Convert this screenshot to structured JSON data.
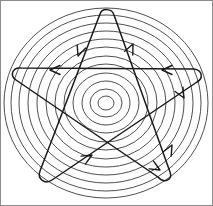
{
  "figure": {
    "name": "pentagram-over-concentric-circles",
    "background_color": "#ffffff",
    "border_color": "#8c8c8c",
    "width": 213,
    "height": 206
  },
  "chart_data": {
    "type": "diagram",
    "title": "",
    "subtitle": "",
    "xlabel": "",
    "ylabel": "",
    "center": {
      "x": 106,
      "y": 103
    },
    "rings": {
      "name": "concentric-circles",
      "count": 12,
      "stroke_color": "#3a3a3a",
      "stroke_width": 0.9,
      "radii_x": [
        8,
        16,
        24,
        33,
        42,
        51,
        60,
        69,
        78,
        87,
        95,
        102
      ],
      "radii_y": [
        7,
        14,
        22,
        30,
        39,
        47,
        56,
        64,
        72,
        80,
        88,
        95
      ]
    },
    "star": {
      "name": "pentagram-path",
      "points": 5,
      "stroke_color": "#1a1a1a",
      "stroke_width": 1.5,
      "closed": true,
      "vertex_style": "rounded-loop",
      "vertices": [
        {
          "label": "top",
          "x": 106,
          "y": 12
        },
        {
          "label": "lower-right",
          "x": 168,
          "y": 178
        },
        {
          "label": "left",
          "x": 12,
          "y": 72
        },
        {
          "label": "right",
          "x": 200,
          "y": 72
        },
        {
          "label": "lower-left",
          "x": 44,
          "y": 178
        }
      ],
      "direction": "clockwise-traversal"
    },
    "arrows": {
      "name": "direction-arrowheads",
      "count": 8,
      "color": "#1a1a1a",
      "items": [
        {
          "id": "arrow-top-left-descent",
          "x": 78,
          "y": 56,
          "direction": "down-left",
          "angle_deg": 250
        },
        {
          "id": "arrow-upper-horizontal-left",
          "x": 50,
          "y": 70,
          "direction": "left",
          "angle_deg": 180
        },
        {
          "id": "arrow-upper-horizontal-right",
          "x": 162,
          "y": 70,
          "direction": "left",
          "angle_deg": 180
        },
        {
          "id": "arrow-top-right-ascent",
          "x": 133,
          "y": 44,
          "direction": "up-right",
          "angle_deg": 65
        },
        {
          "id": "arrow-right-descent",
          "x": 184,
          "y": 98,
          "direction": "down-right",
          "angle_deg": 300
        },
        {
          "id": "arrow-lower-right-ascent",
          "x": 172,
          "y": 145,
          "direction": "up-right",
          "angle_deg": 62
        },
        {
          "id": "arrow-center-bottom-ascent",
          "x": 92,
          "y": 155,
          "direction": "up-right",
          "angle_deg": 30
        },
        {
          "id": "arrow-lower-left-descent",
          "x": 160,
          "y": 170,
          "direction": "down-right",
          "angle_deg": 330
        }
      ]
    },
    "legend": {
      "entries": [],
      "position": "none"
    },
    "grid": false,
    "annotations": []
  }
}
